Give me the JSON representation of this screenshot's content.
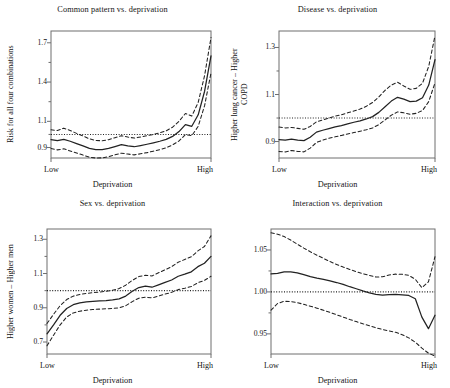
{
  "figure": {
    "background": "#ffffff",
    "line_color": "#222222",
    "axis_color": "#6e6e6e",
    "layout": "2x2 panel grid"
  },
  "chart_data": [
    {
      "type": "line",
      "panel_index": 1,
      "title": "Common pattern vs. deprivation",
      "xlabel": "Deprivation",
      "ylabel": "Risk for all four combinations",
      "xticks": [
        "Low",
        "High"
      ],
      "yticks": [
        "0.9",
        "1.1",
        "1.4",
        "1.7"
      ],
      "ytick_values": [
        0.9,
        1.1,
        1.4,
        1.7
      ],
      "ylim": [
        0.82,
        1.79
      ],
      "xlim": [
        0,
        1
      ],
      "grid": false,
      "legend": "none",
      "reference_line": 1.0,
      "x": [
        0.0,
        0.04,
        0.08,
        0.12,
        0.16,
        0.2,
        0.24,
        0.28,
        0.32,
        0.36,
        0.4,
        0.44,
        0.48,
        0.52,
        0.56,
        0.6,
        0.64,
        0.68,
        0.72,
        0.76,
        0.8,
        0.84,
        0.88,
        0.92,
        0.96,
        1.0
      ],
      "series": [
        {
          "name": "estimate",
          "style": "solid",
          "values": [
            0.96,
            0.952,
            0.963,
            0.948,
            0.93,
            0.912,
            0.893,
            0.884,
            0.884,
            0.893,
            0.907,
            0.922,
            0.913,
            0.906,
            0.915,
            0.925,
            0.936,
            0.948,
            0.962,
            0.985,
            1.022,
            1.075,
            1.062,
            1.15,
            1.33,
            1.6
          ]
        },
        {
          "name": "upper_ci",
          "style": "dashed",
          "values": [
            1.035,
            1.03,
            1.048,
            1.03,
            1.008,
            0.988,
            0.966,
            0.954,
            0.952,
            0.96,
            0.975,
            0.99,
            0.98,
            0.972,
            0.98,
            0.99,
            1.0,
            1.012,
            1.028,
            1.055,
            1.1,
            1.16,
            1.14,
            1.245,
            1.45,
            1.74
          ]
        },
        {
          "name": "lower_ci",
          "style": "dashed",
          "values": [
            0.892,
            0.882,
            0.89,
            0.874,
            0.858,
            0.842,
            0.826,
            0.82,
            0.821,
            0.83,
            0.844,
            0.857,
            0.85,
            0.844,
            0.852,
            0.861,
            0.872,
            0.884,
            0.898,
            0.92,
            0.95,
            0.998,
            0.99,
            1.062,
            1.22,
            1.47
          ]
        }
      ]
    },
    {
      "type": "line",
      "panel_index": 2,
      "title": "Disease vs. deprivation",
      "xlabel": "Deprivation",
      "ylabel": "Higher lung cancer – Higher\nCOPD",
      "xticks": [
        "Low",
        "High"
      ],
      "yticks": [
        "0.9",
        "1.1",
        "1.3"
      ],
      "ytick_values": [
        0.9,
        1.1,
        1.3
      ],
      "ylim": [
        0.83,
        1.37
      ],
      "xlim": [
        0,
        1
      ],
      "grid": false,
      "legend": "none",
      "reference_line": 1.0,
      "x": [
        0.0,
        0.04,
        0.08,
        0.12,
        0.16,
        0.2,
        0.24,
        0.28,
        0.32,
        0.36,
        0.4,
        0.44,
        0.48,
        0.52,
        0.56,
        0.6,
        0.64,
        0.68,
        0.72,
        0.76,
        0.8,
        0.84,
        0.88,
        0.92,
        0.96,
        1.0
      ],
      "series": [
        {
          "name": "estimate",
          "style": "solid",
          "values": [
            0.908,
            0.906,
            0.91,
            0.906,
            0.904,
            0.918,
            0.94,
            0.948,
            0.955,
            0.962,
            0.968,
            0.975,
            0.982,
            0.988,
            0.996,
            1.006,
            1.024,
            1.048,
            1.072,
            1.088,
            1.08,
            1.07,
            1.072,
            1.086,
            1.14,
            1.248
          ]
        },
        {
          "name": "upper_ci",
          "style": "dashed",
          "values": [
            0.962,
            0.958,
            0.96,
            0.956,
            0.952,
            0.964,
            0.984,
            0.992,
            1.0,
            1.008,
            1.014,
            1.022,
            1.03,
            1.038,
            1.05,
            1.066,
            1.09,
            1.118,
            1.14,
            1.152,
            1.136,
            1.122,
            1.126,
            1.148,
            1.22,
            1.35
          ]
        },
        {
          "name": "lower_ci",
          "style": "dashed",
          "values": [
            0.858,
            0.856,
            0.862,
            0.858,
            0.856,
            0.872,
            0.896,
            0.906,
            0.914,
            0.92,
            0.926,
            0.932,
            0.938,
            0.944,
            0.95,
            0.958,
            0.972,
            0.992,
            1.012,
            1.026,
            1.022,
            1.016,
            1.02,
            1.032,
            1.07,
            1.15
          ]
        }
      ]
    },
    {
      "type": "line",
      "panel_index": 3,
      "title": "Sex vs. deprivation",
      "xlabel": "Deprivation",
      "ylabel": "Higher women – Higher men",
      "xticks": [
        "Low",
        "High"
      ],
      "yticks": [
        "0.7",
        "0.9",
        "1.1",
        "1.3"
      ],
      "ytick_values": [
        0.7,
        0.9,
        1.1,
        1.3
      ],
      "ylim": [
        0.63,
        1.36
      ],
      "xlim": [
        0,
        1
      ],
      "grid": false,
      "legend": "none",
      "reference_line": 1.0,
      "x": [
        0.0,
        0.04,
        0.08,
        0.12,
        0.16,
        0.2,
        0.24,
        0.28,
        0.32,
        0.36,
        0.4,
        0.44,
        0.48,
        0.52,
        0.56,
        0.6,
        0.64,
        0.68,
        0.72,
        0.76,
        0.8,
        0.84,
        0.88,
        0.92,
        0.96,
        1.0
      ],
      "series": [
        {
          "name": "estimate",
          "style": "solid",
          "values": [
            0.748,
            0.8,
            0.856,
            0.896,
            0.918,
            0.928,
            0.934,
            0.938,
            0.94,
            0.942,
            0.946,
            0.952,
            0.968,
            0.996,
            1.018,
            1.026,
            1.02,
            1.034,
            1.048,
            1.062,
            1.084,
            1.096,
            1.11,
            1.14,
            1.16,
            1.2
          ]
        },
        {
          "name": "upper_ci",
          "style": "dashed",
          "values": [
            0.808,
            0.862,
            0.912,
            0.948,
            0.968,
            0.978,
            0.984,
            0.988,
            0.992,
            0.996,
            1.002,
            1.012,
            1.032,
            1.06,
            1.082,
            1.09,
            1.086,
            1.104,
            1.122,
            1.14,
            1.166,
            1.182,
            1.198,
            1.232,
            1.258,
            1.32
          ]
        },
        {
          "name": "lower_ci",
          "style": "dashed",
          "values": [
            0.678,
            0.74,
            0.8,
            0.846,
            0.87,
            0.88,
            0.886,
            0.89,
            0.892,
            0.894,
            0.896,
            0.9,
            0.912,
            0.936,
            0.956,
            0.962,
            0.958,
            0.968,
            0.98,
            0.99,
            1.006,
            1.014,
            1.024,
            1.046,
            1.06,
            1.084
          ]
        }
      ]
    },
    {
      "type": "line",
      "panel_index": 4,
      "title": "Interaction vs. deprivation",
      "xlabel": "Deprivation",
      "ylabel": "",
      "xticks": [
        "Low",
        "High"
      ],
      "yticks": [
        "0.95",
        "1.00",
        "1.05"
      ],
      "ytick_values": [
        0.95,
        1.0,
        1.05
      ],
      "ylim": [
        0.926,
        1.075
      ],
      "xlim": [
        0,
        1
      ],
      "grid": false,
      "legend": "none",
      "reference_line": 1.0,
      "x": [
        0.0,
        0.04,
        0.08,
        0.12,
        0.16,
        0.2,
        0.24,
        0.28,
        0.32,
        0.36,
        0.4,
        0.44,
        0.48,
        0.52,
        0.56,
        0.6,
        0.64,
        0.68,
        0.72,
        0.76,
        0.8,
        0.84,
        0.88,
        0.92,
        0.96,
        1.0
      ],
      "series": [
        {
          "name": "estimate",
          "style": "solid",
          "values": [
            1.0215,
            1.0222,
            1.0238,
            1.024,
            1.0228,
            1.0205,
            1.0182,
            1.0165,
            1.015,
            1.0132,
            1.0112,
            1.009,
            1.0062,
            1.0038,
            1.0012,
            0.9988,
            0.997,
            0.9962,
            0.9968,
            0.9972,
            0.9966,
            0.9958,
            0.9918,
            0.97,
            0.9562,
            0.9722
          ]
        },
        {
          "name": "upper_ci",
          "style": "dashed",
          "values": [
            1.0705,
            1.0688,
            1.066,
            1.0618,
            1.057,
            1.0522,
            1.0478,
            1.0438,
            1.04,
            1.0362,
            1.0328,
            1.0296,
            1.0268,
            1.0242,
            1.0218,
            1.0196,
            1.0178,
            1.018,
            1.0202,
            1.0212,
            1.021,
            1.0198,
            1.015,
            1.005,
            1.012,
            1.042
          ]
        },
        {
          "name": "lower_ci",
          "style": "dashed",
          "values": [
            0.9782,
            0.9862,
            0.9888,
            0.9886,
            0.9872,
            0.9852,
            0.983,
            0.9806,
            0.9782,
            0.9756,
            0.9728,
            0.97,
            0.9672,
            0.9646,
            0.962,
            0.9596,
            0.9572,
            0.9552,
            0.9536,
            0.9518,
            0.949,
            0.9452,
            0.94,
            0.933,
            0.927,
            0.9236
          ]
        }
      ]
    }
  ]
}
